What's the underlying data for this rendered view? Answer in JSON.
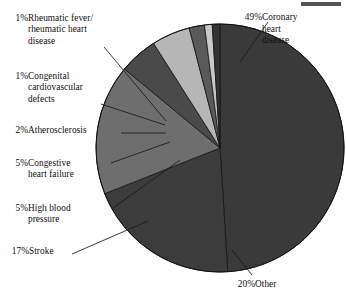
{
  "chart_data": {
    "type": "pie",
    "title": "",
    "units": "percent",
    "total": 100,
    "start_angle_deg": -90,
    "direction": "clockwise",
    "center": {
      "x": 220,
      "y": 148
    },
    "radius": 124,
    "legend": "callout labels with leader lines",
    "grid": false,
    "categories": [
      "Coronary heart disease",
      "Other",
      "Stroke",
      "High blood pressure",
      "Congestive heart failure",
      "Atherosclerosis",
      "Congenital cardiovascular defects",
      "Rheumatic fever/rheumatic heart disease"
    ],
    "values": [
      49,
      20,
      17,
      5,
      5,
      2,
      1,
      1
    ],
    "colors": [
      "#3a3a3a",
      "#3c3c3c",
      "#6e6e6e",
      "#4a4a4a",
      "#b6b6b6",
      "#5a5a5a",
      "#c9c9c9",
      "#333333"
    ],
    "slices": [
      {
        "label": "Coronary heart disease",
        "value": 49,
        "pct_text": "49%",
        "color": "#3a3a3a"
      },
      {
        "label": "Other",
        "value": 20,
        "pct_text": "20%",
        "color": "#3c3c3c"
      },
      {
        "label": "Stroke",
        "value": 17,
        "pct_text": "17%",
        "color": "#6e6e6e"
      },
      {
        "label": "High blood pressure",
        "value": 5,
        "pct_text": "5%",
        "color": "#4a4a4a"
      },
      {
        "label": "Congestive heart failure",
        "value": 5,
        "pct_text": "5%",
        "color": "#b6b6b6"
      },
      {
        "label": "Atherosclerosis",
        "value": 2,
        "pct_text": "2%",
        "color": "#5a5a5a"
      },
      {
        "label": "Congenital cardiovascular defects",
        "value": 1,
        "pct_text": "1%",
        "color": "#c9c9c9"
      },
      {
        "label": "Rheumatic fever/rheumatic heart disease",
        "value": 1,
        "pct_text": "1%",
        "color": "#333333"
      }
    ]
  },
  "labels": {
    "rheumatic": {
      "pct": "1%",
      "text": "Rheumatic fever/\nrheumatic heart\ndisease"
    },
    "congenital": {
      "pct": "1%",
      "text": "Congenital\ncardiovascular\ndefects"
    },
    "athero": {
      "pct": "2%",
      "text": "Atherosclerosis"
    },
    "chf": {
      "pct": "5%",
      "text": "Congestive\nheart failure"
    },
    "hbp": {
      "pct": "5%",
      "text": "High blood\npressure"
    },
    "stroke": {
      "pct": "17%",
      "text": "Stroke"
    },
    "coronary": {
      "pct": "49%",
      "text": "Coronary\nheart\ndisease"
    },
    "other": {
      "pct": "20%",
      "text": "Other"
    }
  }
}
